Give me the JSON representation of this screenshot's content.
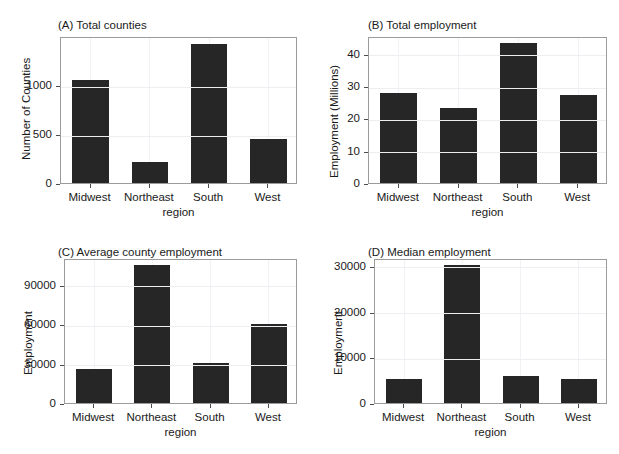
{
  "figure": {
    "background_color": "#ffffff",
    "bar_color": "#262626",
    "panel_border_color": "#9b9b9b",
    "gridline_color": "#ededf2",
    "layout": "2x2 grid of bar charts"
  },
  "chart_data": [
    {
      "id": "A",
      "type": "bar",
      "title": "(A) Total counties",
      "xlabel": "region",
      "ylabel": "Number of Counties",
      "categories": [
        "Midwest",
        "Northeast",
        "South",
        "West"
      ],
      "values": [
        1055,
        215,
        1420,
        450
      ],
      "yticks": [
        0,
        500,
        1000
      ],
      "ytick_labels": [
        "0",
        "500",
        "1000"
      ],
      "ylim": [
        0,
        1500
      ],
      "grid": true,
      "legend": "none"
    },
    {
      "id": "B",
      "type": "bar",
      "title": "(B) Total employment",
      "xlabel": "region",
      "ylabel": "Employment (Millions)",
      "categories": [
        "Midwest",
        "Northeast",
        "South",
        "West"
      ],
      "values": [
        27.8,
        23.1,
        43.2,
        27.2
      ],
      "yticks": [
        0,
        10,
        20,
        30,
        40
      ],
      "ytick_labels": [
        "0",
        "10",
        "20",
        "30",
        "40"
      ],
      "ylim": [
        0,
        45.5
      ],
      "grid": true,
      "legend": "none"
    },
    {
      "id": "C",
      "type": "bar",
      "title": "(C) Average county employment",
      "xlabel": "region",
      "ylabel": "Employment",
      "categories": [
        "Midwest",
        "Northeast",
        "South",
        "West"
      ],
      "values": [
        26000,
        105000,
        30500,
        60500
      ],
      "yticks": [
        0,
        30000,
        60000,
        90000
      ],
      "ytick_labels": [
        "0",
        "30000",
        "60000",
        "90000"
      ],
      "ylim": [
        0,
        110500
      ],
      "grid": true,
      "legend": "none"
    },
    {
      "id": "D",
      "type": "bar",
      "title": "(D) Median employment",
      "xlabel": "region",
      "ylabel": "Employment",
      "categories": [
        "Midwest",
        "Northeast",
        "South",
        "West"
      ],
      "values": [
        5200,
        30100,
        6000,
        5300
      ],
      "yticks": [
        0,
        10000,
        20000,
        30000
      ],
      "ytick_labels": [
        "0",
        "10000",
        "20000",
        "30000"
      ],
      "ylim": [
        0,
        31700
      ],
      "grid": true,
      "legend": "none"
    }
  ]
}
